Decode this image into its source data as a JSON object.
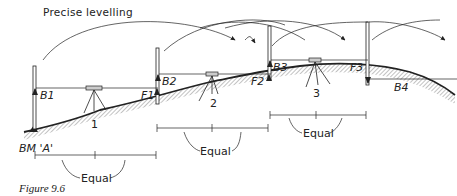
{
  "title": "Precise levelling",
  "caption": "Figure 9.6",
  "benchmark_label": "BM 'A'",
  "staff_readings": {
    "B1": "B1",
    "F1": "F1",
    "B2": "B2",
    "F2": "F2",
    "B3": "B3",
    "F3": "F3",
    "B4": "B4"
  },
  "instrument_stations": [
    "1",
    "2",
    "3"
  ],
  "equal_labels": [
    "Equal",
    "Equal",
    "Equal"
  ],
  "colors": {
    "line": "#222222",
    "ground_hatch": "#999999",
    "background": "#ffffff"
  }
}
